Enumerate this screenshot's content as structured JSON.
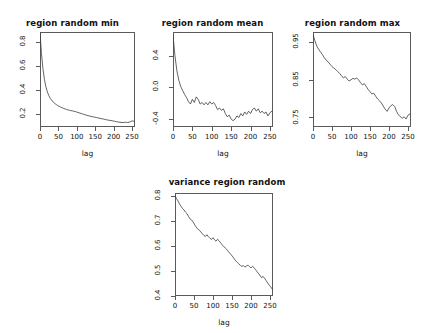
{
  "figure": {
    "background": "#ffffff",
    "line_color": "#3c3c3c",
    "axis_color": "#5a5a5a",
    "layout": "2 rows: three panels on top row, one centered panel on bottom row"
  },
  "chart_data": [
    {
      "type": "line",
      "title": "region random min",
      "xlabel": "lag",
      "ylabel": "",
      "xlim": [
        0,
        258
      ],
      "ylim": [
        0.09,
        0.88
      ],
      "xticks": [
        0,
        50,
        100,
        150,
        200,
        250
      ],
      "xticklabels": [
        "0",
        "50",
        "100",
        "150",
        "200",
        "250"
      ],
      "yticks": [
        0.2,
        0.4,
        0.6,
        0.8
      ],
      "yticklabels": [
        "0.2",
        "0.4",
        "0.6",
        "0.8"
      ],
      "grid": false,
      "legend": false,
      "x": [
        0,
        4,
        8,
        12,
        16,
        20,
        24,
        28,
        32,
        36,
        40,
        44,
        48,
        52,
        56,
        60,
        64,
        68,
        72,
        76,
        80,
        84,
        88,
        92,
        96,
        100,
        106,
        112,
        118,
        124,
        130,
        136,
        142,
        148,
        154,
        160,
        166,
        172,
        178,
        184,
        190,
        196,
        202,
        208,
        214,
        220,
        226,
        232,
        238,
        244,
        250,
        255
      ],
      "values": [
        0.875,
        0.7,
        0.575,
        0.487,
        0.425,
        0.382,
        0.351,
        0.328,
        0.311,
        0.297,
        0.286,
        0.277,
        0.269,
        0.262,
        0.256,
        0.25,
        0.245,
        0.24,
        0.236,
        0.232,
        0.229,
        0.226,
        0.224,
        0.221,
        0.218,
        0.214,
        0.208,
        0.202,
        0.196,
        0.19,
        0.185,
        0.18,
        0.176,
        0.172,
        0.168,
        0.164,
        0.16,
        0.156,
        0.152,
        0.148,
        0.145,
        0.142,
        0.138,
        0.134,
        0.131,
        0.128,
        0.127,
        0.13,
        0.127,
        0.132,
        0.141,
        0.138
      ]
    },
    {
      "type": "line",
      "title": "region random mean",
      "xlabel": "lag",
      "ylabel": "",
      "xlim": [
        0,
        258
      ],
      "ylim": [
        -0.5,
        0.7
      ],
      "xticks": [
        0,
        50,
        100,
        150,
        200,
        250
      ],
      "xticklabels": [
        "0",
        "50",
        "100",
        "150",
        "200",
        "250"
      ],
      "yticks": [
        -0.4,
        0.0,
        0.4
      ],
      "yticklabels": [
        "-0.4",
        "0.0",
        "0.4"
      ],
      "grid": false,
      "legend": false,
      "x": [
        0,
        5,
        10,
        15,
        20,
        25,
        30,
        35,
        40,
        45,
        50,
        55,
        60,
        65,
        70,
        75,
        80,
        85,
        90,
        95,
        100,
        105,
        110,
        115,
        120,
        125,
        130,
        135,
        140,
        145,
        150,
        155,
        160,
        165,
        170,
        175,
        180,
        185,
        190,
        195,
        200,
        205,
        210,
        215,
        220,
        225,
        230,
        235,
        240,
        245,
        250,
        255
      ],
      "values": [
        0.66,
        0.4,
        0.21,
        0.09,
        0.01,
        -0.04,
        -0.09,
        -0.13,
        -0.18,
        -0.21,
        -0.15,
        -0.19,
        -0.12,
        -0.15,
        -0.21,
        -0.19,
        -0.22,
        -0.19,
        -0.22,
        -0.18,
        -0.21,
        -0.19,
        -0.23,
        -0.28,
        -0.26,
        -0.29,
        -0.27,
        -0.33,
        -0.37,
        -0.35,
        -0.4,
        -0.42,
        -0.4,
        -0.36,
        -0.38,
        -0.33,
        -0.36,
        -0.31,
        -0.34,
        -0.3,
        -0.33,
        -0.28,
        -0.26,
        -0.3,
        -0.27,
        -0.32,
        -0.3,
        -0.33,
        -0.31,
        -0.36,
        -0.32,
        -0.3
      ]
    },
    {
      "type": "line",
      "title": "region random max",
      "xlabel": "lag",
      "ylabel": "",
      "xlim": [
        0,
        258
      ],
      "ylim": [
        0.725,
        0.975
      ],
      "xticks": [
        0,
        50,
        100,
        150,
        200,
        250
      ],
      "xticklabels": [
        "0",
        "50",
        "100",
        "150",
        "200",
        "250"
      ],
      "yticks": [
        0.75,
        0.85,
        0.95
      ],
      "yticklabels": [
        "0.75",
        "0.85",
        "0.95"
      ],
      "grid": false,
      "legend": false,
      "x": [
        0,
        5,
        10,
        15,
        20,
        25,
        30,
        35,
        40,
        45,
        50,
        55,
        60,
        65,
        70,
        75,
        80,
        85,
        90,
        95,
        100,
        105,
        110,
        115,
        120,
        125,
        130,
        135,
        140,
        145,
        150,
        155,
        160,
        165,
        170,
        175,
        180,
        185,
        190,
        195,
        200,
        205,
        210,
        215,
        220,
        225,
        230,
        235,
        240,
        245,
        250,
        255
      ],
      "values": [
        0.968,
        0.952,
        0.938,
        0.929,
        0.922,
        0.915,
        0.907,
        0.901,
        0.896,
        0.89,
        0.884,
        0.88,
        0.876,
        0.871,
        0.866,
        0.86,
        0.854,
        0.858,
        0.851,
        0.846,
        0.849,
        0.853,
        0.851,
        0.854,
        0.849,
        0.842,
        0.836,
        0.839,
        0.832,
        0.824,
        0.818,
        0.812,
        0.814,
        0.806,
        0.799,
        0.794,
        0.788,
        0.78,
        0.772,
        0.766,
        0.775,
        0.781,
        0.784,
        0.779,
        0.766,
        0.757,
        0.752,
        0.748,
        0.752,
        0.746,
        0.756,
        0.759
      ]
    },
    {
      "type": "line",
      "title": "variance region random",
      "xlabel": "lag",
      "ylabel": "",
      "xlim": [
        0,
        258
      ],
      "ylim": [
        0.4,
        0.81
      ],
      "xticks": [
        0,
        50,
        100,
        150,
        200,
        250
      ],
      "xticklabels": [
        "0",
        "50",
        "100",
        "150",
        "200",
        "250"
      ],
      "yticks": [
        0.4,
        0.5,
        0.6,
        0.7,
        0.8
      ],
      "yticklabels": [
        "0.4",
        "0.5",
        "0.6",
        "0.7",
        "0.8"
      ],
      "grid": false,
      "legend": false,
      "x": [
        0,
        4,
        8,
        12,
        16,
        20,
        24,
        28,
        32,
        36,
        40,
        44,
        48,
        52,
        56,
        60,
        64,
        68,
        72,
        76,
        80,
        84,
        88,
        92,
        96,
        100,
        104,
        108,
        112,
        116,
        120,
        124,
        128,
        132,
        136,
        140,
        144,
        148,
        152,
        156,
        160,
        164,
        168,
        172,
        176,
        180,
        184,
        188,
        192,
        196,
        200,
        204,
        208,
        212,
        216,
        220,
        224,
        228,
        232,
        236,
        240,
        244,
        248,
        252,
        256
      ],
      "values": [
        0.8,
        0.788,
        0.778,
        0.766,
        0.757,
        0.748,
        0.742,
        0.733,
        0.727,
        0.716,
        0.706,
        0.702,
        0.694,
        0.683,
        0.674,
        0.666,
        0.662,
        0.655,
        0.648,
        0.641,
        0.637,
        0.644,
        0.636,
        0.63,
        0.625,
        0.632,
        0.624,
        0.618,
        0.626,
        0.62,
        0.612,
        0.604,
        0.597,
        0.592,
        0.586,
        0.578,
        0.571,
        0.564,
        0.556,
        0.548,
        0.54,
        0.534,
        0.528,
        0.522,
        0.518,
        0.521,
        0.515,
        0.519,
        0.523,
        0.517,
        0.512,
        0.518,
        0.513,
        0.505,
        0.497,
        0.489,
        0.481,
        0.473,
        0.478,
        0.47,
        0.461,
        0.452,
        0.443,
        0.436,
        0.428
      ]
    }
  ]
}
